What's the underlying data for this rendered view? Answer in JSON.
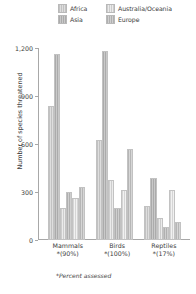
{
  "chart_data": {
    "type": "bar",
    "title": "",
    "xlabel": "",
    "ylabel": "Number of species threatened",
    "ylim": [
      0,
      1200
    ],
    "grid": false,
    "legend_position": "top",
    "categories": [
      "Mammals",
      "Birds",
      "Reptiles"
    ],
    "category_sublabels": [
      "*(90%)",
      "*(100%)",
      "*(17%)"
    ],
    "ytick_labels": [
      "1,200",
      "900",
      "600",
      "300",
      "0"
    ],
    "ytick_values": [
      1200,
      900,
      600,
      300,
      0
    ],
    "legend_entries": [
      "Africa",
      "Australia/Oceania",
      "Asia",
      "Europe"
    ],
    "footnote": "*Percent assessed",
    "series": [
      {
        "name": "Africa",
        "values": [
          835,
          625,
          215
        ]
      },
      {
        "name": "Asia",
        "values": [
          1165,
          1180,
          385
        ]
      },
      {
        "name": "Australia/Oceania",
        "values": [
          200,
          375,
          140
        ]
      },
      {
        "name": "Europe",
        "values": [
          300,
          200,
          80
        ]
      },
      {
        "name": "Series 5",
        "values": [
          265,
          310,
          310
        ]
      },
      {
        "name": "Series 6",
        "values": [
          330,
          570,
          110
        ]
      }
    ]
  },
  "legend": {
    "items": [
      {
        "label": "Africa"
      },
      {
        "label": "Australia/Oceania"
      },
      {
        "label": "Asia"
      },
      {
        "label": "Europe"
      }
    ]
  },
  "axis": {
    "y_title": "Number of species threatened"
  },
  "footnote": {
    "text": "*Percent assessed"
  }
}
